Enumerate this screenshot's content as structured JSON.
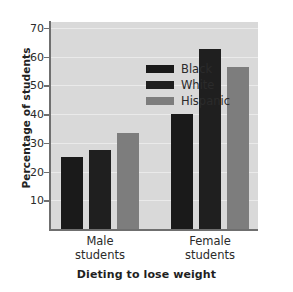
{
  "chart_data": {
    "type": "bar",
    "title": "",
    "xlabel": "Dieting to lose weight",
    "ylabel": "Percentage of students",
    "categories": [
      "Male students",
      "Female students"
    ],
    "category_lines": [
      [
        "Male",
        "students"
      ],
      [
        "Female",
        "students"
      ]
    ],
    "series": [
      {
        "name": "Black",
        "values": [
          25,
          40
        ],
        "color": "#1a1a1a"
      },
      {
        "name": "White",
        "values": [
          27.5,
          62.5
        ],
        "color": "#1f1f1f"
      },
      {
        "name": "Hispanic",
        "values": [
          33.5,
          56.5
        ],
        "color": "#7d7d7d"
      }
    ],
    "ylim": [
      0,
      72
    ],
    "yticks": [
      10,
      20,
      30,
      40,
      50,
      60,
      70
    ],
    "ytick_labels": [
      "10",
      "20",
      "30",
      "40",
      "50",
      "60",
      "70"
    ],
    "grid": true,
    "legend_position": "upper-left-inside",
    "plot_background": "#d9d9d9",
    "gridline_color": "#eaeaea",
    "axis_color": "#6f6f6f"
  }
}
